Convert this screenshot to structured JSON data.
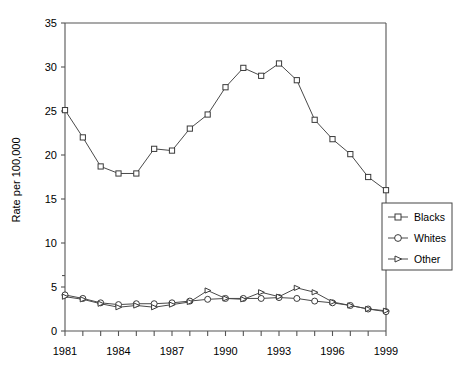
{
  "chart_data": {
    "type": "line",
    "title": "",
    "subtitle": "",
    "xlabel": "",
    "ylabel": "Rate per 100,000",
    "x": [
      1981,
      1982,
      1983,
      1984,
      1985,
      1986,
      1987,
      1988,
      1989,
      1990,
      1991,
      1992,
      1993,
      1994,
      1995,
      1996,
      1997,
      1998,
      1999
    ],
    "xtick_labels": [
      "1981",
      "1984",
      "1987",
      "1990",
      "1993",
      "1996",
      "1999"
    ],
    "xtick_values": [
      1981,
      1984,
      1987,
      1990,
      1993,
      1996,
      1999
    ],
    "ytick_labels": [
      "0",
      "5",
      "10",
      "15",
      "20",
      "25",
      "30",
      "35"
    ],
    "ytick_values": [
      0,
      5,
      10,
      15,
      20,
      25,
      30,
      35
    ],
    "xlim": [
      1981,
      1999
    ],
    "ylim": [
      0,
      35
    ],
    "grid": false,
    "legend_position": "right-middle",
    "series": [
      {
        "name": "Blacks",
        "marker": "square",
        "values": [
          25.1,
          22.0,
          18.7,
          17.9,
          17.9,
          20.7,
          20.5,
          23.0,
          24.6,
          27.7,
          29.9,
          29.0,
          30.4,
          28.5,
          24.0,
          21.8,
          20.1,
          17.5,
          16.0
        ]
      },
      {
        "name": "Whites",
        "marker": "circle",
        "values": [
          4.1,
          3.7,
          3.2,
          3.0,
          3.1,
          3.1,
          3.2,
          3.4,
          3.6,
          3.7,
          3.7,
          3.7,
          3.8,
          3.7,
          3.4,
          3.2,
          2.9,
          2.5,
          2.2
        ]
      },
      {
        "name": "Other",
        "marker": "triangle",
        "values": [
          3.9,
          3.6,
          3.1,
          2.7,
          2.9,
          2.7,
          3.0,
          3.3,
          4.6,
          3.7,
          3.6,
          4.4,
          3.9,
          4.9,
          4.4,
          3.3,
          2.9,
          2.5,
          2.3
        ]
      }
    ]
  },
  "legend": {
    "entries": [
      {
        "label": "Blacks",
        "marker": "square"
      },
      {
        "label": "Whites",
        "marker": "circle"
      },
      {
        "label": "Other",
        "marker": "triangle"
      }
    ]
  },
  "colors": {
    "line": "#4a4a4a",
    "marker_stroke": "#3a3a3a",
    "marker_fill": "#ffffff",
    "axis": "#555555",
    "background": "#ffffff",
    "text": "#000000"
  }
}
